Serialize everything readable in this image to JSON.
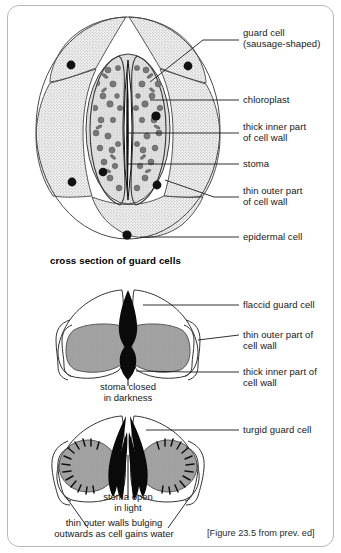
{
  "figure": {
    "citation": "[Figure 23.5 from prev. ed]",
    "section_caption": "cross section of guard cells"
  },
  "colors": {
    "border": "#b8b8b8",
    "stipple_fill": "#ececec",
    "cell_outline": "#3c3c3c",
    "chloroplast": "#7a7a7a",
    "nucleus": "#111111",
    "wall_gray": "#9a9a9a",
    "leader": "#1a1a1a",
    "text": "#181818"
  },
  "top_view": {
    "labels": [
      {
        "id": "guard-cell",
        "text": "guard cell\n(sausage-shaped)"
      },
      {
        "id": "chloroplast",
        "text": "chloroplast"
      },
      {
        "id": "thick-inner-wall",
        "text": "thick inner part\nof cell wall"
      },
      {
        "id": "stoma",
        "text": "stoma"
      },
      {
        "id": "thin-outer-wall",
        "text": "thin outer part\nof cell wall"
      },
      {
        "id": "epidermal-cell",
        "text": "epidermal cell"
      }
    ]
  },
  "closed_view": {
    "labels": [
      {
        "id": "flaccid-guard-cell",
        "text": "flaccid guard cell"
      },
      {
        "id": "thin-outer-wall",
        "text": "thin outer part of\ncell wall"
      },
      {
        "id": "thick-inner-wall",
        "text": "thick inner part of\ncell wall"
      }
    ],
    "caption": "stoma closed\nin darkness"
  },
  "open_view": {
    "labels": [
      {
        "id": "turgid-guard-cell",
        "text": "turgid guard cell"
      }
    ],
    "caption": "stoma open\nin light",
    "note": "thin outer walls bulging\noutwards as cell gains water"
  }
}
